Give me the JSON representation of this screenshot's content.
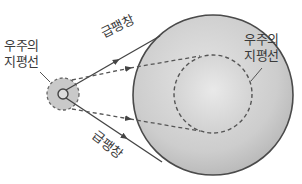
{
  "diagram": {
    "title": "",
    "labels": {
      "left_horizon_line1": "우주의",
      "left_horizon_line2": "지평선",
      "right_horizon_line1": "우주의",
      "right_horizon_line2": "지평선",
      "top_inflation": "급팽창",
      "bottom_inflation": "급팽창"
    },
    "colors": {
      "big_circle_fill": "#c8c8c8",
      "small_circle_fill": "#c9c9c9",
      "stroke": "#4a4a4a",
      "dash": "#555555"
    }
  }
}
